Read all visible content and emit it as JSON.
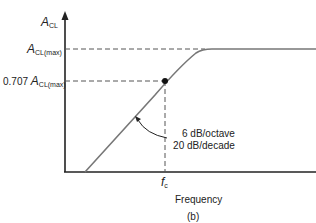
{
  "figure": {
    "y_axis_label_main": "A",
    "y_axis_label_sub": "CL",
    "max_label_main": "A",
    "max_label_sub": "CL(max)",
    "cutoff_label_prefix": "0.707",
    "cutoff_label_main": "A",
    "cutoff_label_sub": "CL(max)",
    "slope_line1": "6 dB/octave",
    "slope_line2": "20 dB/decade",
    "fc_main": "f",
    "fc_sub": "c",
    "x_axis_label": "Frequency",
    "caption": "(b)"
  },
  "colors": {
    "axis": "#222222",
    "curve": "#777777",
    "dashed": "#555555"
  }
}
